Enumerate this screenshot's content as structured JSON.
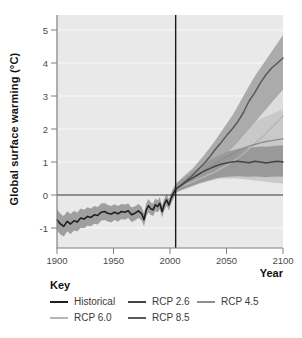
{
  "colors": {
    "plot_bg": "#e9e9e9",
    "gridline": "#f9f9f9",
    "axis": "#808080",
    "tick_text": "#4a4a4a",
    "reference_line": "#1a1a1a",
    "zero_line": "#2e2e2e"
  },
  "legend": {
    "title": "Key",
    "items": [
      {
        "label": "Historical",
        "color": "#1f1f1f"
      },
      {
        "label": "RCP 2.6",
        "color": "#454545"
      },
      {
        "label": "RCP 4.5",
        "color": "#8e8e8e"
      },
      {
        "label": "RCP 6.0",
        "color": "#b6b6b6"
      },
      {
        "label": "RCP 8.5",
        "color": "#595959"
      }
    ]
  },
  "chart_data": {
    "type": "line",
    "title": "",
    "xlabel": "Year",
    "ylabel": "Global surface warming (°C)",
    "xlim": [
      1900,
      2100
    ],
    "ylim": [
      -1.6,
      5.45
    ],
    "x_ticks": [
      1900,
      1950,
      2000,
      2050,
      2100
    ],
    "y_ticks": [
      -1,
      0,
      1,
      2,
      3,
      4,
      5
    ],
    "grid": true,
    "legend_position": "bottom",
    "reference_lines": {
      "vertical_year": 2005,
      "horizontal_value": 0
    },
    "series": [
      {
        "name": "RCP 6.0",
        "color": "#b6b6b6",
        "band_color": "#dddddd",
        "line_width": 1.4,
        "x": [
          2005,
          2010,
          2015,
          2020,
          2025,
          2030,
          2035,
          2040,
          2045,
          2050,
          2055,
          2060,
          2065,
          2070,
          2075,
          2080,
          2085,
          2090,
          2095,
          2100
        ],
        "values": [
          0.18,
          0.26,
          0.33,
          0.4,
          0.48,
          0.55,
          0.63,
          0.7,
          0.8,
          0.9,
          1.0,
          1.12,
          1.25,
          1.4,
          1.55,
          1.7,
          1.87,
          2.05,
          2.22,
          2.4
        ],
        "band_upper": [
          0.3,
          0.42,
          0.55,
          0.68,
          0.82,
          0.97,
          1.12,
          1.28,
          1.45,
          1.6,
          1.78,
          1.95,
          2.12,
          2.3,
          2.48,
          2.65,
          2.82,
          3.0,
          3.15,
          3.3
        ],
        "band_lower": [
          0.08,
          0.13,
          0.18,
          0.24,
          0.3,
          0.36,
          0.42,
          0.48,
          0.55,
          0.62,
          0.7,
          0.78,
          0.86,
          0.95,
          1.03,
          1.12,
          1.2,
          1.28,
          1.35,
          1.4
        ]
      },
      {
        "name": "RCP 4.5",
        "color": "#8e8e8e",
        "band_color": "#c9c9c9",
        "line_width": 1.4,
        "x": [
          2005,
          2010,
          2015,
          2020,
          2025,
          2030,
          2035,
          2040,
          2045,
          2050,
          2055,
          2060,
          2065,
          2070,
          2075,
          2080,
          2085,
          2090,
          2095,
          2100
        ],
        "values": [
          0.18,
          0.28,
          0.38,
          0.5,
          0.62,
          0.73,
          0.85,
          0.95,
          1.06,
          1.15,
          1.25,
          1.33,
          1.42,
          1.48,
          1.53,
          1.58,
          1.62,
          1.65,
          1.68,
          1.7
        ],
        "band_upper": [
          0.3,
          0.45,
          0.6,
          0.78,
          0.95,
          1.1,
          1.28,
          1.42,
          1.58,
          1.7,
          1.82,
          1.92,
          2.02,
          2.1,
          2.2,
          2.3,
          2.38,
          2.45,
          2.52,
          2.6
        ],
        "band_lower": [
          0.08,
          0.14,
          0.2,
          0.27,
          0.33,
          0.38,
          0.43,
          0.47,
          0.5,
          0.5,
          0.5,
          0.5,
          0.48,
          0.46,
          0.44,
          0.42,
          0.4,
          0.38,
          0.36,
          0.35
        ]
      },
      {
        "name": "RCP 8.5",
        "color": "#595959",
        "band_color": "#ababab",
        "line_width": 1.5,
        "x": [
          2005,
          2010,
          2015,
          2020,
          2025,
          2030,
          2035,
          2040,
          2045,
          2050,
          2055,
          2060,
          2065,
          2070,
          2075,
          2080,
          2085,
          2090,
          2095,
          2100
        ],
        "values": [
          0.18,
          0.3,
          0.45,
          0.6,
          0.78,
          0.95,
          1.15,
          1.38,
          1.58,
          1.8,
          2.0,
          2.22,
          2.5,
          2.85,
          3.1,
          3.4,
          3.65,
          3.85,
          4.0,
          4.15
        ],
        "band_upper": [
          0.35,
          0.5,
          0.65,
          0.8,
          1.0,
          1.2,
          1.42,
          1.65,
          1.9,
          2.15,
          2.4,
          2.7,
          3.0,
          3.3,
          3.6,
          3.85,
          4.1,
          4.35,
          4.6,
          4.85
        ],
        "band_lower": [
          0.1,
          0.2,
          0.3,
          0.4,
          0.52,
          0.65,
          0.8,
          0.95,
          1.1,
          1.25,
          1.42,
          1.6,
          1.8,
          2.0,
          2.2,
          2.4,
          2.6,
          2.8,
          3.0,
          3.2
        ]
      },
      {
        "name": "RCP 2.6",
        "color": "#454545",
        "band_color": "#999999",
        "line_width": 1.5,
        "x": [
          2005,
          2010,
          2015,
          2020,
          2025,
          2030,
          2035,
          2040,
          2045,
          2050,
          2055,
          2060,
          2065,
          2070,
          2075,
          2080,
          2085,
          2090,
          2095,
          2100
        ],
        "values": [
          0.18,
          0.3,
          0.42,
          0.52,
          0.62,
          0.72,
          0.8,
          0.87,
          0.93,
          0.97,
          1.0,
          1.02,
          1.0,
          0.98,
          1.02,
          1.0,
          0.97,
          1.0,
          1.02,
          1.0
        ],
        "band_upper": [
          0.3,
          0.45,
          0.58,
          0.7,
          0.82,
          0.95,
          1.05,
          1.15,
          1.22,
          1.3,
          1.35,
          1.4,
          1.42,
          1.44,
          1.45,
          1.47,
          1.46,
          1.48,
          1.5,
          1.5
        ],
        "band_lower": [
          0.08,
          0.15,
          0.22,
          0.28,
          0.35,
          0.4,
          0.45,
          0.5,
          0.53,
          0.55,
          0.56,
          0.57,
          0.56,
          0.55,
          0.56,
          0.55,
          0.54,
          0.55,
          0.56,
          0.55
        ]
      },
      {
        "name": "Historical",
        "color": "#1f1f1f",
        "band_color": "#9f9f9f",
        "line_width": 1.6,
        "x": [
          1900,
          1903,
          1906,
          1909,
          1912,
          1915,
          1918,
          1921,
          1924,
          1927,
          1930,
          1933,
          1936,
          1939,
          1942,
          1945,
          1948,
          1951,
          1954,
          1957,
          1960,
          1963,
          1966,
          1969,
          1972,
          1975,
          1977,
          1979,
          1981,
          1983,
          1985,
          1987,
          1989,
          1991,
          1993,
          1995,
          1997,
          1999,
          2001,
          2003,
          2005
        ],
        "values": [
          -0.75,
          -0.88,
          -0.95,
          -0.8,
          -0.88,
          -0.78,
          -0.82,
          -0.7,
          -0.73,
          -0.65,
          -0.68,
          -0.6,
          -0.62,
          -0.52,
          -0.5,
          -0.55,
          -0.58,
          -0.52,
          -0.57,
          -0.5,
          -0.52,
          -0.48,
          -0.6,
          -0.55,
          -0.48,
          -0.57,
          -0.75,
          -0.45,
          -0.32,
          -0.42,
          -0.45,
          -0.3,
          -0.35,
          -0.25,
          -0.5,
          -0.28,
          -0.15,
          -0.3,
          -0.1,
          0.05,
          0.18
        ],
        "band_upper": [
          -0.43,
          -0.57,
          -0.64,
          -0.49,
          -0.58,
          -0.48,
          -0.53,
          -0.41,
          -0.45,
          -0.37,
          -0.41,
          -0.33,
          -0.36,
          -0.26,
          -0.24,
          -0.3,
          -0.33,
          -0.28,
          -0.33,
          -0.27,
          -0.29,
          -0.26,
          -0.38,
          -0.34,
          -0.27,
          -0.36,
          -0.55,
          -0.25,
          -0.12,
          -0.23,
          -0.26,
          -0.11,
          -0.17,
          -0.07,
          -0.32,
          -0.11,
          0.02,
          -0.13,
          0.07,
          0.21,
          0.34
        ],
        "band_lower": [
          -1.07,
          -1.2,
          -1.26,
          -1.11,
          -1.18,
          -1.08,
          -1.11,
          -0.99,
          -1.01,
          -0.93,
          -0.95,
          -0.87,
          -0.89,
          -0.78,
          -0.76,
          -0.8,
          -0.83,
          -0.76,
          -0.81,
          -0.73,
          -0.75,
          -0.7,
          -0.82,
          -0.77,
          -0.69,
          -0.78,
          -0.95,
          -0.65,
          -0.52,
          -0.61,
          -0.64,
          -0.49,
          -0.53,
          -0.43,
          -0.68,
          -0.46,
          -0.32,
          -0.47,
          -0.27,
          -0.11,
          0.02
        ]
      }
    ]
  }
}
